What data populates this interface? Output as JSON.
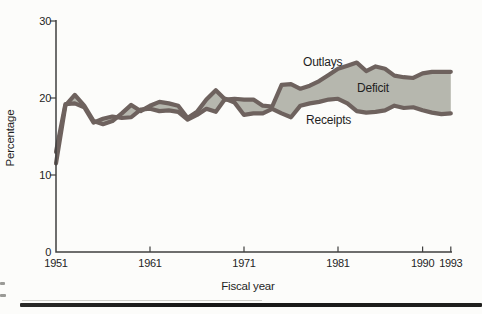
{
  "figure": {
    "background_color": "#fcfcfa",
    "bottom_rule": true
  },
  "colors": {
    "line": "#6e625e",
    "band_fill": "#b6b7ae",
    "axis": "#3f3f3f",
    "text": "#1f1f1f",
    "rule": "#1a1a1a"
  },
  "chart_data": {
    "type": "area",
    "title": "",
    "xlabel": "Fiscal year",
    "ylabel": "Percentage",
    "band_label": "Deficit",
    "xlim": [
      1951,
      1993
    ],
    "ylim": [
      0,
      30
    ],
    "x_ticks": [
      1951,
      1961,
      1971,
      1981,
      1990,
      1993
    ],
    "y_ticks": [
      0,
      10,
      20,
      30
    ],
    "grid": false,
    "legend": "inline-annotations",
    "x": [
      1951,
      1952,
      1953,
      1954,
      1955,
      1956,
      1957,
      1958,
      1959,
      1960,
      1961,
      1962,
      1963,
      1964,
      1965,
      1966,
      1967,
      1968,
      1969,
      1970,
      1971,
      1972,
      1973,
      1974,
      1975,
      1976,
      1977,
      1978,
      1979,
      1980,
      1981,
      1982,
      1983,
      1984,
      1985,
      1986,
      1987,
      1988,
      1989,
      1990,
      1991,
      1992,
      1993
    ],
    "series": [
      {
        "name": "Outlays",
        "values": [
          11.5,
          19.0,
          20.4,
          19.0,
          17.0,
          16.6,
          17.0,
          18.0,
          19.1,
          18.3,
          19.0,
          19.5,
          19.3,
          19.0,
          17.4,
          18.2,
          19.8,
          21.0,
          19.8,
          19.9,
          19.8,
          19.8,
          19.0,
          18.9,
          21.7,
          21.8,
          21.2,
          21.6,
          22.2,
          23.0,
          23.8,
          24.2,
          24.6,
          23.5,
          24.1,
          23.8,
          22.9,
          22.7,
          22.6,
          23.2,
          23.4,
          23.4,
          23.4
        ]
      },
      {
        "name": "Receipts",
        "values": [
          13.0,
          19.2,
          19.3,
          18.8,
          16.8,
          17.3,
          17.6,
          17.4,
          17.5,
          18.5,
          18.6,
          18.3,
          18.4,
          18.2,
          17.2,
          17.8,
          18.6,
          18.2,
          19.9,
          19.4,
          17.8,
          18.0,
          18.0,
          18.6,
          18.0,
          17.5,
          19.0,
          19.3,
          19.5,
          19.8,
          19.9,
          19.3,
          18.3,
          18.1,
          18.2,
          18.4,
          19.0,
          18.7,
          18.8,
          18.4,
          18.1,
          17.9,
          18.0
        ]
      }
    ]
  }
}
